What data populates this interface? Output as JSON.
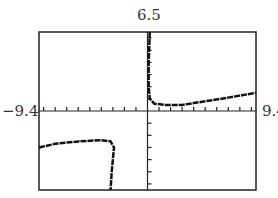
{
  "chart_data": {
    "type": "line",
    "title": "",
    "xlabel": "",
    "ylabel": "",
    "xlim": [
      -9.4,
      9.4
    ],
    "ylim": [
      -6.5,
      6.5
    ],
    "tick_labels": {
      "x_min": "-9.4",
      "x_max": "9.4",
      "y_max": "6.5"
    },
    "x_tick_step": 1,
    "y_tick_step": 1,
    "grid": false,
    "series": [
      {
        "name": "left branch",
        "points": [
          [
            -9.4,
            -3.0
          ],
          [
            -8,
            -2.7
          ],
          [
            -6,
            -2.5
          ],
          [
            -4,
            -2.4
          ],
          [
            -3.2,
            -2.5
          ],
          [
            -2.9,
            -3
          ],
          [
            -3.0,
            -4
          ],
          [
            -3.1,
            -5
          ],
          [
            -3.2,
            -6.5
          ]
        ]
      },
      {
        "name": "right branch",
        "points": [
          [
            0.2,
            6.5
          ],
          [
            0.1,
            4
          ],
          [
            0.1,
            2
          ],
          [
            0.2,
            1
          ],
          [
            0.6,
            0.6
          ],
          [
            1.5,
            0.5
          ],
          [
            3,
            0.5
          ],
          [
            5,
            0.8
          ],
          [
            7,
            1.1
          ],
          [
            9.4,
            1.5
          ]
        ]
      }
    ]
  },
  "labels": {
    "y_max": "6.5",
    "x_min": "−9.4",
    "x_max": "9.4"
  }
}
